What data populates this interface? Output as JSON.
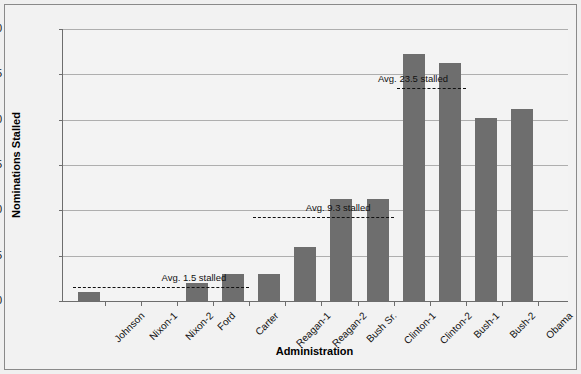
{
  "chart_data": {
    "type": "bar",
    "title": "",
    "xlabel": "Administration",
    "ylabel": "Nominations Stalled",
    "ylim": [
      0,
      30
    ],
    "yticks": [
      0,
      5,
      10,
      15,
      20,
      25,
      30
    ],
    "ytick_labels": [
      "0",
      "5",
      "10",
      "15",
      "20",
      "25",
      "30"
    ],
    "grid": "horizontal",
    "legend": "none",
    "bar_color": "#6e6e6e",
    "categories": [
      "Johnson",
      "Nixon-1",
      "Nixon-2",
      "Ford",
      "Carter",
      "Reagan-1",
      "Reagan-2",
      "Bush Sr.",
      "Clinton-1",
      "Clinton-2",
      "Bush-1",
      "Bush-2",
      "Obama"
    ],
    "values": [
      1,
      0,
      0,
      2,
      3,
      3,
      6,
      11.2,
      11.2,
      27.2,
      26.3,
      20.2,
      21.2
    ],
    "annotations": [
      {
        "label": "Avg. 1.5 stalled",
        "value": 1.5,
        "span_start_category": "Johnson",
        "span_end_category": "Carter"
      },
      {
        "label": "Avg. 9.3 stalled",
        "value": 9.3,
        "span_start_category": "Reagan-1",
        "span_end_category": "Clinton-1"
      },
      {
        "label": "Avg. 23.5 stalled",
        "value": 23.5,
        "span_start_category": "Clinton-2",
        "span_end_category": "Bush-1"
      }
    ]
  }
}
